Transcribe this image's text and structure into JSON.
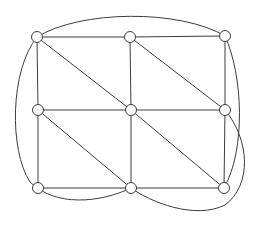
{
  "figure": {
    "width": 261,
    "height": 225,
    "background_color": "#ffffff"
  },
  "style": {
    "edge_color": "#3c3c3c",
    "edge_width": 1,
    "vertex_fill": "#ffffff",
    "vertex_stroke": "#3c3c3c",
    "vertex_stroke_width": 1,
    "vertex_radius": 5.5
  },
  "graph": {
    "vertex_count": 9,
    "edge_count": 20,
    "vertices": [
      {
        "id": "v1",
        "label": "top-left",
        "x": 37,
        "y": 37
      },
      {
        "id": "v2",
        "label": "top-center",
        "x": 130,
        "y": 37
      },
      {
        "id": "v3",
        "label": "top-right",
        "x": 225,
        "y": 36
      },
      {
        "id": "v4",
        "label": "middle-left",
        "x": 38,
        "y": 110
      },
      {
        "id": "v5",
        "label": "center",
        "x": 131,
        "y": 110
      },
      {
        "id": "v6",
        "label": "middle-right",
        "x": 225,
        "y": 110
      },
      {
        "id": "v7",
        "label": "bottom-left",
        "x": 38,
        "y": 188
      },
      {
        "id": "v8",
        "label": "bottom-center",
        "x": 131,
        "y": 188
      },
      {
        "id": "v9",
        "label": "bottom-right",
        "x": 224,
        "y": 188
      }
    ],
    "straight_edges": [
      {
        "id": "e1",
        "from": "v1",
        "to": "v2",
        "kind": "horizontal"
      },
      {
        "id": "e2",
        "from": "v2",
        "to": "v3",
        "kind": "horizontal"
      },
      {
        "id": "e3",
        "from": "v4",
        "to": "v5",
        "kind": "horizontal"
      },
      {
        "id": "e4",
        "from": "v5",
        "to": "v6",
        "kind": "horizontal"
      },
      {
        "id": "e5",
        "from": "v7",
        "to": "v8",
        "kind": "horizontal"
      },
      {
        "id": "e6",
        "from": "v8",
        "to": "v9",
        "kind": "horizontal"
      },
      {
        "id": "e7",
        "from": "v1",
        "to": "v4",
        "kind": "vertical"
      },
      {
        "id": "e8",
        "from": "v4",
        "to": "v7",
        "kind": "vertical"
      },
      {
        "id": "e9",
        "from": "v2",
        "to": "v5",
        "kind": "vertical"
      },
      {
        "id": "e10",
        "from": "v5",
        "to": "v8",
        "kind": "vertical"
      },
      {
        "id": "e11",
        "from": "v3",
        "to": "v6",
        "kind": "vertical"
      },
      {
        "id": "e12",
        "from": "v6",
        "to": "v9",
        "kind": "vertical"
      },
      {
        "id": "e13",
        "from": "v1",
        "to": "v5",
        "kind": "diagonal"
      },
      {
        "id": "e14",
        "from": "v2",
        "to": "v6",
        "kind": "diagonal"
      },
      {
        "id": "e15",
        "from": "v4",
        "to": "v8",
        "kind": "diagonal"
      },
      {
        "id": "e16",
        "from": "v5",
        "to": "v9",
        "kind": "diagonal"
      }
    ],
    "curved_edges": [
      {
        "id": "c1",
        "from": "v1",
        "to": "v3",
        "label": "top-arc",
        "path": "M 37 37 C 80 10, 180 9, 225 36"
      },
      {
        "id": "c2",
        "from": "v1",
        "to": "v8",
        "label": "left-outer-sweep",
        "path": "M 37 37 C 10 70, 9 150, 30 182 C 55 207, 100 203, 131 188"
      },
      {
        "id": "c3",
        "from": "v3",
        "to": "v9",
        "label": "right-outer-arc",
        "path": "M 225 36 C 243 75, 246 150, 224 188"
      },
      {
        "id": "c4",
        "from": "v6",
        "to": "v8",
        "label": "right-bottom-sweep",
        "path": "M 225 110 C 250 140, 252 185, 225 205 C 195 220, 150 202, 131 188"
      }
    ]
  }
}
